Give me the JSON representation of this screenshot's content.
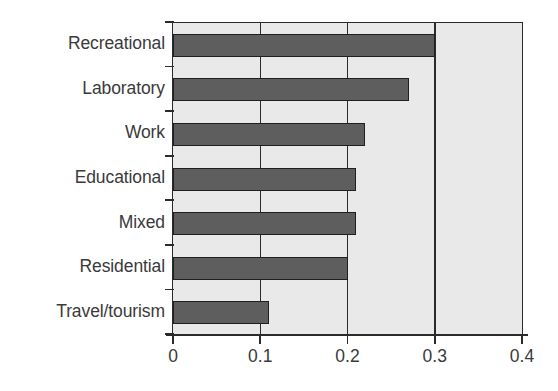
{
  "chart_data": {
    "type": "bar",
    "orientation": "horizontal",
    "title": "",
    "subtitle": "",
    "xlabel": "",
    "ylabel": "",
    "categories": [
      "Recreational",
      "Laboratory",
      "Work",
      "Educational",
      "Mixed",
      "Residential",
      "Travel/tourism"
    ],
    "values": [
      0.3,
      0.27,
      0.22,
      0.21,
      0.21,
      0.2,
      0.11
    ],
    "xlim": [
      0,
      0.4
    ],
    "xticks": [
      0,
      0.1,
      0.2,
      0.3,
      0.4
    ],
    "xtick_labels": [
      "0",
      "0.1",
      "0.2",
      "0.3",
      "0.4"
    ],
    "grid": "vertical",
    "legend": "none",
    "colors": {
      "bar_fill": "#5e5e5e",
      "bar_border": "#1f1f1f",
      "plot_background": "#e9e9e9",
      "axis": "#2b2b2b",
      "text": "#3a3a3a",
      "page_background": "#ffffff"
    }
  }
}
